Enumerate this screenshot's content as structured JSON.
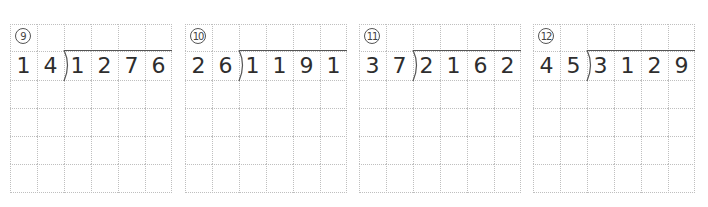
{
  "problems": [
    {
      "label": "9",
      "divisor": [
        "1",
        "4"
      ],
      "dividend": [
        "1",
        "2",
        "7",
        "6"
      ],
      "left": 10
    },
    {
      "label": "10",
      "divisor": [
        "2",
        "6"
      ],
      "dividend": [
        "1",
        "1",
        "9",
        "1"
      ],
      "left": 185
    },
    {
      "label": "11",
      "divisor": [
        "3",
        "7"
      ],
      "dividend": [
        "2",
        "1",
        "6",
        "2"
      ],
      "left": 359
    },
    {
      "label": "12",
      "divisor": [
        "4",
        "5"
      ],
      "dividend": [
        "3",
        "1",
        "2",
        "9"
      ],
      "left": 533
    }
  ],
  "grid": {
    "columns": 6,
    "rows": 6,
    "line_color": "#bfbfbf"
  },
  "colors": {
    "digit": "#2e2e2e",
    "bracket": "#555555"
  }
}
